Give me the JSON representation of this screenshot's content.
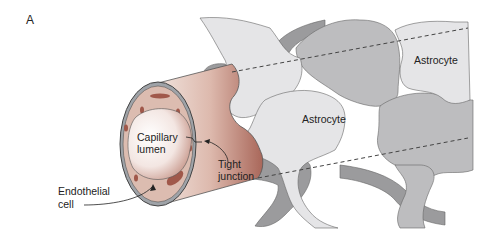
{
  "figure": {
    "panel_label": "A",
    "labels": {
      "capillary_lumen_1": "Capillary",
      "capillary_lumen_2": "lumen",
      "tight_junction_1": "Tight",
      "tight_junction_2": "junction",
      "endothelial_cell_1": "Endothelial",
      "endothelial_cell_2": "cell",
      "astrocyte_center": "Astrocyte",
      "astrocyte_right": "Astrocyte"
    },
    "colors": {
      "capillary": "#c9968a",
      "capillary_dark": "#a86a5c",
      "astrocyte_light": "#e6e6e8",
      "astrocyte_mid": "#bdbdbf",
      "astrocyte_dark": "#9a9a9c",
      "outline": "#555555"
    }
  }
}
